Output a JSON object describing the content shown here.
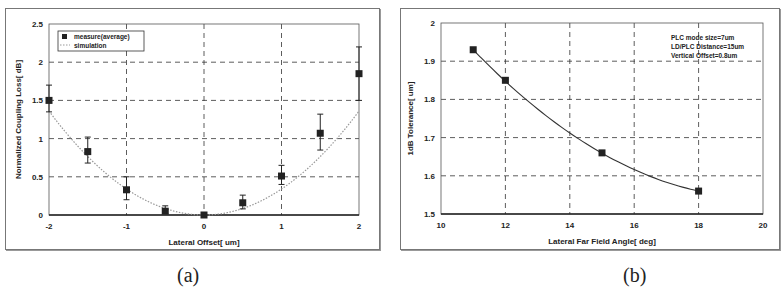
{
  "captions": {
    "a": "(a)",
    "b": "(b)"
  },
  "chart_data": [
    {
      "type": "scatter",
      "panel": "a",
      "title": "",
      "xlabel": "Lateral Offset[ um]",
      "ylabel": "Normalized Coupling Loss[ dB]",
      "xlim": [
        -2,
        2
      ],
      "ylim": [
        0,
        2.5
      ],
      "xticks": [
        "-2",
        "-1",
        "0",
        "1",
        "2"
      ],
      "yticks": [
        "0",
        "0.5",
        "1",
        "1.5",
        "2",
        "2.5"
      ],
      "grid": true,
      "legend": {
        "position": "upper-left",
        "entries": [
          "measure(average)",
          "simulation"
        ]
      },
      "series": [
        {
          "name": "measure(average)",
          "style": "square-markers-with-error-bars",
          "x": [
            -2,
            -1.5,
            -1,
            -0.5,
            0,
            0.5,
            1,
            1.5,
            2
          ],
          "y": [
            1.5,
            0.83,
            0.33,
            0.05,
            0.0,
            0.16,
            0.51,
            1.07,
            1.85
          ],
          "err_low": [
            1.35,
            0.68,
            0.2,
            0.02,
            0.0,
            0.08,
            0.4,
            0.85,
            1.5
          ],
          "err_high": [
            1.7,
            1.02,
            0.5,
            0.12,
            0.0,
            0.26,
            0.65,
            1.32,
            2.2
          ]
        },
        {
          "name": "simulation",
          "style": "dotted-line",
          "x": [
            -2,
            -1.5,
            -1,
            -0.5,
            0,
            0.5,
            1,
            1.5,
            2
          ],
          "y": [
            1.35,
            0.75,
            0.33,
            0.08,
            0.0,
            0.08,
            0.33,
            0.75,
            1.35
          ]
        }
      ]
    },
    {
      "type": "line",
      "panel": "b",
      "title": "",
      "xlabel": "Lateral Far Field Angle[ deg]",
      "ylabel": "1dB Tolerance[ um]",
      "xlim": [
        10,
        20
      ],
      "ylim": [
        1.5,
        2
      ],
      "xticks": [
        "10",
        "12",
        "14",
        "16",
        "18",
        "20"
      ],
      "yticks": [
        "1.5",
        "1.6",
        "1.7",
        "1.8",
        "1.9",
        "2"
      ],
      "grid": true,
      "annotations": [
        "PLC mode size=7um",
        "LD/PLC Distance=15um",
        "Vertical Offset=0.8um"
      ],
      "series": [
        {
          "name": "1dB Tolerance",
          "style": "square-markers-with-smooth-line",
          "x": [
            11,
            12,
            15,
            18
          ],
          "y": [
            1.93,
            1.85,
            1.66,
            1.56
          ]
        }
      ]
    }
  ]
}
